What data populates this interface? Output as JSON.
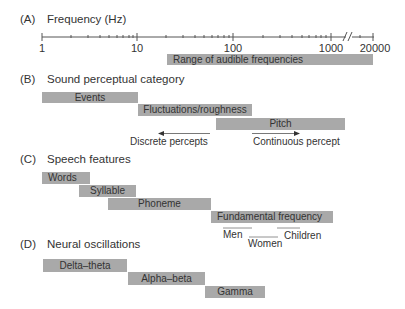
{
  "panels": {
    "a": {
      "letter": "(A)",
      "title": "Frequency (Hz)",
      "axis": {
        "scale": "log",
        "tick_labels": [
          "1",
          "10",
          "100",
          "1000",
          "20000"
        ],
        "break_between": [
          "1000",
          "20000"
        ]
      },
      "bars": [
        {
          "label": "Range of audible frequencies",
          "from_hz": 20,
          "to_hz": 20000
        }
      ]
    },
    "b": {
      "letter": "(B)",
      "title": "Sound perceptual category",
      "bars": [
        {
          "label": "Events",
          "from_hz": 1,
          "to_hz": 10
        },
        {
          "label": "Fluctuations/roughness",
          "from_hz": 10,
          "to_hz": 150
        },
        {
          "label": "Pitch",
          "from_hz": 60,
          "to_hz": 1200
        }
      ],
      "arrows": [
        {
          "label": "Discrete percepts",
          "direction": "left"
        },
        {
          "label": "Continuous percept",
          "direction": "right"
        }
      ]
    },
    "c": {
      "letter": "(C)",
      "title": "Speech features",
      "bars": [
        {
          "label": "Words",
          "from_hz": 1,
          "to_hz": 3
        },
        {
          "label": "Syllable",
          "from_hz": 2.5,
          "to_hz": 10
        },
        {
          "label": "Phoneme",
          "from_hz": 5,
          "to_hz": 60
        },
        {
          "label": "Fundamental frequency",
          "from_hz": 60,
          "to_hz": 1000
        }
      ],
      "ranges": [
        {
          "label": "Men"
        },
        {
          "label": "Women"
        },
        {
          "label": "Children"
        }
      ]
    },
    "d": {
      "letter": "(D)",
      "title": "Neural oscillations",
      "bars": [
        {
          "label": "Delta–theta",
          "from_hz": 1,
          "to_hz": 8
        },
        {
          "label": "Alpha–beta",
          "from_hz": 8,
          "to_hz": 30
        },
        {
          "label": "Gamma",
          "from_hz": 30,
          "to_hz": 120
        }
      ]
    }
  },
  "colors": {
    "bar_fill": "#a9a9a9",
    "text": "#333333",
    "axis": "#555555",
    "range_line": "#777777"
  }
}
